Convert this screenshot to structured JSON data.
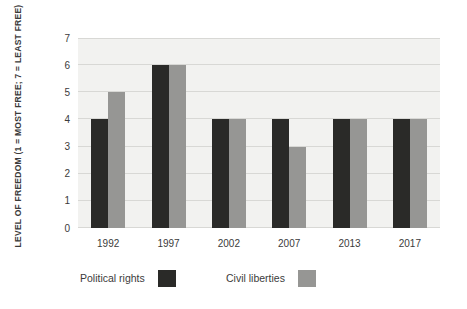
{
  "chart_data": {
    "type": "bar",
    "title": "",
    "ylabel": "LEVEL OF FREEDOM (1 = MOST FREE; 7 = LEAST FREE)",
    "xlabel": "",
    "categories": [
      "1992",
      "1997",
      "2002",
      "2007",
      "2013",
      "2017"
    ],
    "series": [
      {
        "name": "Political rights",
        "color": "#2a2a28",
        "values": [
          4,
          6,
          4,
          4,
          4,
          4
        ]
      },
      {
        "name": "Civil liberties",
        "color": "#969694",
        "values": [
          5,
          6,
          4,
          3,
          4,
          4
        ]
      }
    ],
    "ylim": [
      0,
      7
    ],
    "yticks": [
      0,
      1,
      2,
      3,
      4,
      5,
      6,
      7
    ],
    "grid": "horizontal",
    "legend_position": "bottom",
    "colors": {
      "plot_background": "#f2f2f0",
      "gridline": "#d8d8d5",
      "text": "#3b3b3b",
      "page_background": "#ffffff"
    }
  }
}
